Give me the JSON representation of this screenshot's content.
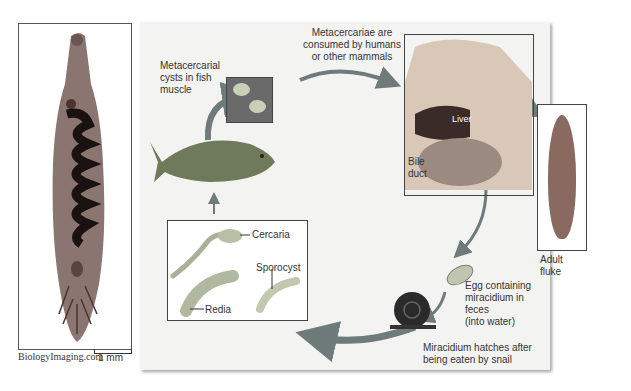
{
  "photo": {
    "credit": "BiologyImaging.com",
    "scale_label": "1 mm"
  },
  "diagram": {
    "labels": {
      "metacercarial_cysts": [
        "Metacercarial",
        "cysts in fish",
        "muscle"
      ],
      "consumed": [
        "Metacercariae are",
        "consumed by humans",
        "or other mammals"
      ],
      "liver": "Liver",
      "bile_duct": [
        "Bile",
        "duct"
      ],
      "adult_fluke": "Adult fluke",
      "egg": [
        "Egg containing",
        "miracidium in feces",
        "(into water)"
      ],
      "miracidium": [
        "Miracidium hatches after",
        "being eaten by snail"
      ],
      "cercaria": "Cercaria",
      "sporocyst": "Sporocyst",
      "redia": "Redia"
    },
    "colors": {
      "panel_bg": "#f3f3f2",
      "arrow": "#6f7a7a",
      "fluke_body": "#8a6a60",
      "organ_dark": "#3a2a28"
    }
  }
}
